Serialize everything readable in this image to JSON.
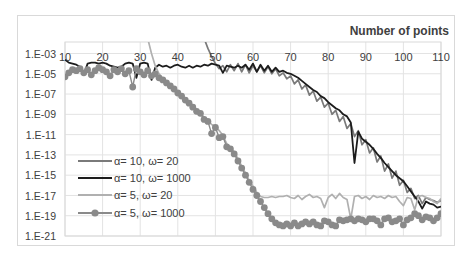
{
  "chart_data": {
    "type": "line",
    "title": "Number of points",
    "xlabel": "Number of points",
    "ylabel": "",
    "y_scale": "log10",
    "xlim": [
      10,
      110
    ],
    "ylim_log10": [
      -21,
      -1.87
    ],
    "x_ticks": [
      "10",
      "20",
      "30",
      "40",
      "50",
      "60",
      "70",
      "80",
      "90",
      "100",
      "110"
    ],
    "y_ticks": [
      "1.E-03",
      "1.E-05",
      "1.E-07",
      "1.E-09",
      "1.E-11",
      "1.E-13",
      "1.E-15",
      "1.E-17",
      "1.E-19",
      "1.E-21"
    ],
    "grid": true,
    "legend_position": "lower-left inside",
    "series": [
      {
        "name": "α= 10, ω= 20",
        "color": "#7a7a7a",
        "marker": "none",
        "x_start": 47,
        "log10_values": [
          -1.5,
          -2.5,
          -3.3,
          -4.0,
          -4.5,
          -4.2,
          -4.8,
          -4.1,
          -4.7,
          -4.0,
          -4.8,
          -4.1,
          -4.9,
          -4.2,
          -4.8,
          -4.2,
          -4.9,
          -4.3,
          -5.0,
          -4.5,
          -5.2,
          -4.9,
          -5.5,
          -5.2,
          -6.0,
          -5.6,
          -6.5,
          -6.1,
          -7.1,
          -6.7,
          -7.7,
          -7.3,
          -8.3,
          -7.9,
          -9.0,
          -8.6,
          -9.7,
          -9.2,
          -10.4,
          -9.9,
          -11.2,
          -10.6,
          -12.0,
          -11.5,
          -12.8,
          -12.3,
          -13.7,
          -13.1,
          -14.6,
          -13.9,
          -15.3,
          -14.6,
          -16.0,
          -15.5,
          -16.7,
          -16.3,
          -17.3,
          -17.0,
          -17.8,
          -17.2,
          -17.4,
          -17.5,
          -17.7,
          -17.5
        ]
      },
      {
        "name": "α= 10, ω= 1000",
        "color": "#1c1c1c",
        "marker": "none",
        "x_start": 10,
        "log10_values": [
          -3.6,
          -3.9,
          -4.0,
          -4.1,
          -4.3,
          -5.1,
          -4.0,
          -3.9,
          -3.9,
          -4.0,
          -3.9,
          -4.0,
          -4.2,
          -4.3,
          -4.4,
          -4.3,
          -4.0,
          -3.9,
          -4.0,
          -5.4,
          -4.0,
          -3.9,
          -4.0,
          -5.6,
          -4.4,
          -4.1,
          -4.3,
          -4.2,
          -4.4,
          -4.2,
          -4.1,
          -4.3,
          -4.4,
          -4.2,
          -4.4,
          -4.2,
          -4.3,
          -4.1,
          -4.2,
          -4.0,
          -4.1,
          -4.2,
          -4.9,
          -4.2,
          -4.3,
          -4.4,
          -4.2,
          -4.4,
          -4.1,
          -4.6,
          -4.0,
          -4.8,
          -4.1,
          -4.7,
          -4.2,
          -4.8,
          -4.4,
          -4.8,
          -4.7,
          -4.9,
          -5.0,
          -5.2,
          -5.4,
          -5.7,
          -6.0,
          -6.3,
          -6.6,
          -6.8,
          -7.2,
          -7.4,
          -7.8,
          -8.1,
          -8.4,
          -8.6,
          -9.0,
          -9.2,
          -9.8,
          -13.8,
          -10.7,
          -11.4,
          -11.7,
          -12.0,
          -12.4,
          -12.9,
          -13.3,
          -13.8,
          -14.2,
          -14.6,
          -15.0,
          -15.3,
          -15.6,
          -16.1,
          -16.6,
          -17.1,
          -17.6,
          -18.3,
          -17.6,
          -17.8,
          -17.9,
          -18.2,
          -18.1
        ]
      },
      {
        "name": "α= 5, ω= 20",
        "color": "#b0b0b0",
        "marker": "none",
        "x_start": 32,
        "log10_values": [
          -1.5,
          -3.0,
          -4.2,
          -5.0,
          -5.5,
          -5.8,
          -6.1,
          -6.4,
          -6.8,
          -7.1,
          -7.5,
          -7.8,
          -8.2,
          -8.6,
          -8.8,
          -9.3,
          -9.6,
          -10.0,
          -10.2,
          -10.6,
          -11.1,
          -11.9,
          -12.3,
          -12.7,
          -13.4,
          -14.1,
          -14.8,
          -15.5,
          -16.1,
          -16.7,
          -17.1,
          -17.2,
          -17.2,
          -17.1,
          -17.2,
          -17.1,
          -17.1,
          -17.0,
          -17.2,
          -17.3,
          -17.0,
          -17.4,
          -17.1,
          -16.9,
          -17.2,
          -17.1,
          -17.3,
          -18.2,
          -17.2,
          -16.9,
          -17.3,
          -16.8,
          -17.2,
          -17.4,
          -19.3,
          -17.1,
          -17.0,
          -17.3,
          -17.1,
          -17.4,
          -17.0,
          -17.2,
          -17.1,
          -17.3,
          -17.0,
          -17.2,
          -17.1,
          -17.6,
          -18.0,
          -17.2,
          -17.3,
          -18.4,
          -17.1,
          -17.0,
          -17.2,
          -17.3,
          -17.6,
          -17.8,
          -17.3
        ]
      },
      {
        "name": "α= 5, ω= 1000",
        "color": "#8a8a8a",
        "marker": "circle",
        "x_start": 10,
        "log10_values": [
          -5.3,
          -4.9,
          -4.6,
          -4.7,
          -4.5,
          -4.9,
          -4.6,
          -5.1,
          -4.7,
          -4.4,
          -4.6,
          -4.8,
          -5.2,
          -4.6,
          -4.8,
          -4.5,
          -5.0,
          -4.7,
          -6.3,
          -4.5,
          -4.8,
          -5.1,
          -4.7,
          -5.2,
          -5.0,
          -5.4,
          -5.6,
          -5.9,
          -6.2,
          -6.5,
          -6.9,
          -7.2,
          -7.6,
          -7.9,
          -8.3,
          -8.7,
          -8.9,
          -9.5,
          -9.7,
          -10.9,
          -10.3,
          -11.3,
          -11.2,
          -12.2,
          -12.4,
          -12.9,
          -13.6,
          -14.3,
          -15.0,
          -15.7,
          -16.4,
          -17.0,
          -17.6,
          -18.2,
          -18.8,
          -19.3,
          -19.7,
          -19.9,
          -20.0,
          -19.8,
          -20.0,
          -19.7,
          -20.0,
          -19.8,
          -19.6,
          -19.8,
          -19.6,
          -19.9,
          -20.0,
          -19.5,
          -19.6,
          -19.9,
          -20.0,
          -19.4,
          -19.5,
          -19.4,
          -19.3,
          -19.5,
          -19.3,
          -19.4,
          -19.6,
          -19.3,
          -19.3,
          -19.5,
          -19.9,
          -19.3,
          -19.2,
          -19.6,
          -19.5,
          -19.3,
          -19.9,
          -19.4,
          -19.2,
          -18.8,
          -19.0,
          -19.4,
          -19.1,
          -19.2,
          -19.5,
          -19.2,
          -18.8
        ]
      }
    ]
  },
  "legend": {
    "items": [
      {
        "label": "α= 10, ω= 20"
      },
      {
        "label": "α= 10, ω= 1000"
      },
      {
        "label": "α= 5, ω= 20"
      },
      {
        "label": "α= 5, ω= 1000"
      }
    ]
  }
}
